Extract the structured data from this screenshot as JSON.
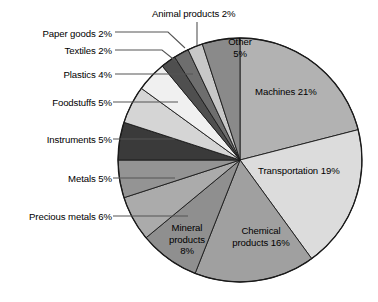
{
  "chart_data": {
    "type": "pie",
    "title": "",
    "subtitle": "",
    "xlabel": "",
    "ylabel": "",
    "legend_position": "none",
    "grid": false,
    "unit": "%",
    "total": 100,
    "start_angle_deg": 0,
    "direction": "clockwise",
    "categories": [
      "Machines",
      "Transportation",
      "Chemical products",
      "Mineral products",
      "Precious metals",
      "Metals",
      "Instruments",
      "Foodstuffs",
      "Plastics",
      "Textiles",
      "Paper goods",
      "Animal products",
      "Other"
    ],
    "values": [
      21,
      19,
      16,
      8,
      6,
      5,
      5,
      5,
      4,
      2,
      2,
      2,
      5
    ],
    "colors": [
      "#b2b2b2",
      "#dcdcdc",
      "#a0a0a0",
      "#8f8f8f",
      "#ababab",
      "#949494",
      "#3a3a3a",
      "#d5d5d5",
      "#f0f0f0",
      "#4f4f4f",
      "#6e6e6e",
      "#c8c8c8",
      "#8a8a8a"
    ],
    "slices": [
      {
        "label": "Machines",
        "value": 21,
        "display": "Machines 21%",
        "color": "#b2b2b2",
        "label_placement": "inside"
      },
      {
        "label": "Transportation",
        "value": 19,
        "display": "Transportation 19%",
        "color": "#dcdcdc",
        "label_placement": "inside"
      },
      {
        "label": "Chemical products",
        "value": 16,
        "display": "Chemical products 16%",
        "color": "#a0a0a0",
        "label_placement": "inside"
      },
      {
        "label": "Mineral products",
        "value": 8,
        "display": "Mineral products 8%",
        "color": "#8f8f8f",
        "label_placement": "inside"
      },
      {
        "label": "Precious metals",
        "value": 6,
        "display": "Precious metals 6%",
        "color": "#ababab",
        "label_placement": "leader-left"
      },
      {
        "label": "Metals",
        "value": 5,
        "display": "Metals 5%",
        "color": "#949494",
        "label_placement": "leader-left"
      },
      {
        "label": "Instruments",
        "value": 5,
        "display": "Instruments 5%",
        "color": "#3a3a3a",
        "label_placement": "leader-left"
      },
      {
        "label": "Foodstuffs",
        "value": 5,
        "display": "Foodstuffs 5%",
        "color": "#d5d5d5",
        "label_placement": "leader-left"
      },
      {
        "label": "Plastics",
        "value": 4,
        "display": "Plastics 4%",
        "color": "#f0f0f0",
        "label_placement": "leader-left"
      },
      {
        "label": "Textiles",
        "value": 2,
        "display": "Textiles 2%",
        "color": "#4f4f4f",
        "label_placement": "leader-left"
      },
      {
        "label": "Paper goods",
        "value": 2,
        "display": "Paper goods 2%",
        "color": "#6e6e6e",
        "label_placement": "leader-left"
      },
      {
        "label": "Animal products",
        "value": 2,
        "display": "Animal products 2%",
        "color": "#c8c8c8",
        "label_placement": "leader-top"
      },
      {
        "label": "Other",
        "value": 5,
        "display": "Other 5%",
        "color": "#8a8a8a",
        "label_placement": "inside"
      }
    ]
  },
  "labels": {
    "paper_goods": "Paper goods 2%",
    "textiles": "Textiles 2%",
    "plastics": "Plastics 4%",
    "foodstuffs": "Foodstuffs 5%",
    "instruments": "Instruments 5%",
    "metals": "Metals 5%",
    "precious_metals": "Precious metals 6%",
    "animal_products": "Animal products 2%",
    "other_line1": "Other",
    "other_line2": "5%",
    "machines": "Machines 21%",
    "transportation": "Transportation 19%",
    "chemical_line1": "Chemical",
    "chemical_line2": "products 16%",
    "mineral_line1": "Mineral",
    "mineral_line2": "products",
    "mineral_line3": "8%"
  },
  "style": {
    "outline": "#1a1a1a",
    "leader_line": "#555555",
    "background": "#ffffff"
  }
}
